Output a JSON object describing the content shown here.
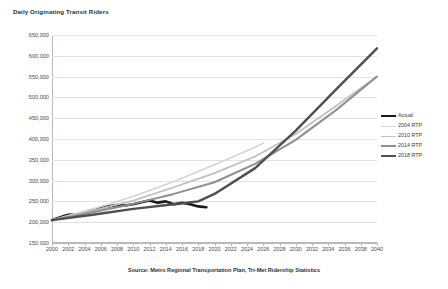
{
  "chart_data": {
    "type": "line",
    "title": "Daily Originating Transit Riders",
    "xlabel": "",
    "ylabel": "",
    "xlim": [
      2000,
      2040
    ],
    "ylim": [
      150000,
      650000
    ],
    "grid": true,
    "legend_position": "right",
    "source_note": "Source:  Metro Regional Transportation Plan, Tri-Met Ridership Statistics",
    "x_ticks": [
      2000,
      2002,
      2004,
      2006,
      2008,
      2010,
      2012,
      2014,
      2016,
      2018,
      2020,
      2022,
      2024,
      2026,
      2028,
      2030,
      2032,
      2034,
      2036,
      2038,
      2040
    ],
    "y_ticks": [
      150000,
      200000,
      250000,
      300000,
      350000,
      400000,
      450000,
      500000,
      550000,
      600000,
      650000
    ],
    "y_tick_labels": [
      "150,000",
      "200,000",
      "250,000",
      "300,000",
      "350,000",
      "400,000",
      "450,000",
      "500,000",
      "550,000",
      "600,000",
      "650,000"
    ],
    "series": [
      {
        "name": "Actual",
        "color": "#1a1a1a",
        "width": 2.6,
        "x": [
          2000,
          2001,
          2002,
          2003,
          2004,
          2005,
          2006,
          2007,
          2008,
          2009,
          2010,
          2011,
          2012,
          2013,
          2014,
          2015,
          2016,
          2017,
          2018,
          2019
        ],
        "values": [
          205000,
          212000,
          218000,
          219000,
          222000,
          228000,
          234000,
          238000,
          241000,
          240000,
          243000,
          248000,
          252000,
          247000,
          250000,
          243000,
          247000,
          243000,
          238000,
          236000
        ]
      },
      {
        "name": "2004 RTP",
        "color": "#d4d4d4",
        "width": 1.6,
        "x": [
          2000,
          2005,
          2010,
          2015,
          2020,
          2025,
          2026
        ],
        "values": [
          205000,
          232000,
          262000,
          298000,
          338000,
          380000,
          390000
        ]
      },
      {
        "name": "2010 RTP",
        "color": "#c0c0c0",
        "width": 1.8,
        "x": [
          2000,
          2005,
          2010,
          2015,
          2020,
          2025,
          2030,
          2035,
          2040
        ],
        "values": [
          205000,
          228000,
          252000,
          284000,
          318000,
          358000,
          412000,
          480000,
          550000
        ]
      },
      {
        "name": "2014 RTP",
        "color": "#8f8f8f",
        "width": 2.0,
        "x": [
          2000,
          2005,
          2010,
          2015,
          2020,
          2025,
          2030,
          2035,
          2040
        ],
        "values": [
          205000,
          224000,
          244000,
          268000,
          296000,
          340000,
          398000,
          470000,
          550000
        ]
      },
      {
        "name": "2018 RTP",
        "color": "#4f4f4f",
        "width": 2.4,
        "x": [
          2000,
          2005,
          2010,
          2015,
          2018,
          2020,
          2025,
          2030,
          2035,
          2040
        ],
        "values": [
          205000,
          218000,
          232000,
          243000,
          250000,
          268000,
          330000,
          420000,
          520000,
          618000
        ]
      }
    ]
  },
  "legend": {
    "items": [
      {
        "label": "Actual"
      },
      {
        "label": "2004 RTP"
      },
      {
        "label": "2010 RTP"
      },
      {
        "label": "2014 RTP"
      },
      {
        "label": "2018 RTP"
      }
    ]
  }
}
